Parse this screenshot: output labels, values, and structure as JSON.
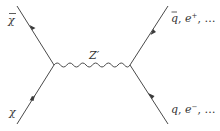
{
  "diagram": {
    "type": "feynman",
    "incoming": {
      "particle": "χ",
      "antiparticle": "χ",
      "particle_label": "χ",
      "antiparticle_label": "χ̄"
    },
    "mediator": {
      "label": "Z′",
      "style": "wavy"
    },
    "outgoing": {
      "top_label": "q̄, e⁺, …",
      "bottom_label": "q, e⁻, …",
      "top_parts": {
        "a": "q",
        "sep1": ", ",
        "b": "e",
        "sup": "+",
        "sep2": ", …"
      },
      "bottom_parts": {
        "a": "q",
        "sep1": ", ",
        "b": "e",
        "sup": "−",
        "sep2": ", …"
      }
    },
    "colors": {
      "line": "#4a4a4a",
      "text": "#333333",
      "background": "#ffffff"
    }
  }
}
